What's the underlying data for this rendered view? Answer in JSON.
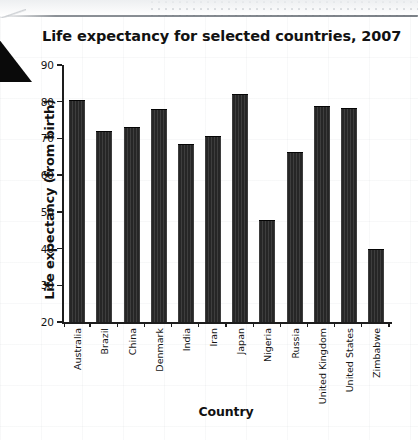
{
  "chart_data": {
    "type": "bar",
    "title": "Life expectancy for selected countries, 2007",
    "xlabel": "Country",
    "ylabel": "Life expectancy (from birth)",
    "categories": [
      "Australia",
      "Brazil",
      "China",
      "Denmark",
      "India",
      "Iran",
      "Japan",
      "Nigeria",
      "Russia",
      "United Kingdom",
      "United States",
      "Zimbabwe"
    ],
    "values": [
      80.5,
      72.0,
      73.0,
      78.0,
      68.5,
      70.7,
      82.0,
      47.7,
      66.2,
      78.9,
      78.3,
      40.0
    ],
    "ylim": [
      20,
      90
    ],
    "ytick_labels": [
      "90",
      "80",
      "70",
      "60",
      "50",
      "40",
      "30",
      "20"
    ],
    "ytick_values": [
      90,
      80,
      70,
      60,
      50,
      40,
      30,
      20
    ],
    "grid": false,
    "legend": false,
    "bar_color": "#262626",
    "axis_color": "#1d1d1d"
  },
  "page": {
    "marker": "black-triangle-marker"
  }
}
